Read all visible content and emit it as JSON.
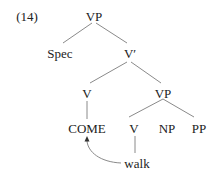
{
  "example_number": "(14)",
  "tree": {
    "root": "VP",
    "spec": "Spec",
    "v_bar": "V′",
    "v_head": "V",
    "vp_lower": "VP",
    "come": "COME",
    "v_lower": "V",
    "np": "NP",
    "pp": "PP",
    "walk": "walk"
  },
  "colors": {
    "line": "#8a8a8a",
    "text": "#222222"
  }
}
